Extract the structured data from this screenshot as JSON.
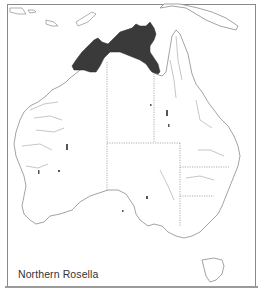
{
  "map": {
    "title": "Northern Rosella",
    "region": "Australia",
    "legend": {
      "range_label": "Northern Rosella",
      "range_color": "#3a3a3a"
    },
    "colors": {
      "background": "#ffffff",
      "coastline": "#8c8c8c",
      "rivers": "#9a9a9a",
      "state_borders": "#9a9a9a",
      "range_fill": "#3a3a3a",
      "frame": "#8a8a8a"
    }
  }
}
